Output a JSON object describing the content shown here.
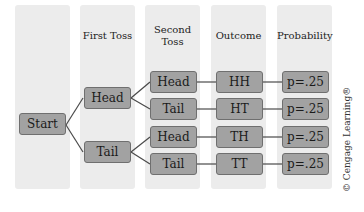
{
  "columns": [
    {
      "header": ""
    },
    {
      "header": "First Toss"
    },
    {
      "header_line1": "Second",
      "header_line2": "Toss"
    },
    {
      "header": "Outcome"
    },
    {
      "header": "Probability"
    }
  ],
  "nodes": {
    "start": "Start",
    "first_toss": [
      "Head",
      "Tail"
    ],
    "second_toss": [
      "Head",
      "Tail",
      "Head",
      "Tail"
    ],
    "outcomes": [
      "HH",
      "HT",
      "TH",
      "TT"
    ],
    "probabilities": [
      "p=.25",
      "p=.25",
      "p=.25",
      "p=.25"
    ]
  },
  "credit": "© Cengage Learning®",
  "colors": {
    "column_bg": "#ececec",
    "node_fill": "#a2a2a2",
    "node_border": "#6f6f6f",
    "line": "#4a4a4a"
  }
}
